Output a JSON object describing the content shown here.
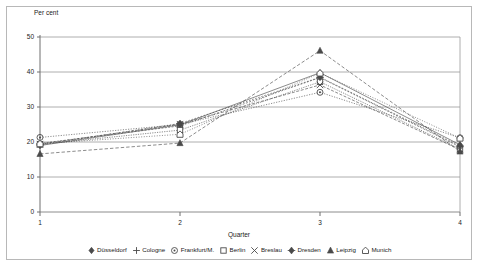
{
  "chart_data": {
    "type": "line",
    "title": "",
    "xlabel": "Quarter",
    "ylabel": "Per cent",
    "x": [
      1,
      2,
      3,
      4
    ],
    "xtick_labels": [
      "1",
      "2",
      "3",
      "4"
    ],
    "ytick_labels": [
      "0",
      "10",
      "20",
      "30",
      "40",
      "50"
    ],
    "yticks": [
      0,
      10,
      20,
      30,
      40,
      50
    ],
    "ylim": [
      0,
      50
    ],
    "xlim": [
      1,
      4
    ],
    "grid": "horizontal",
    "legend_position": "bottom",
    "series": [
      {
        "name": "Düsseldorf",
        "marker": "diamond-filled",
        "values": [
          19.0,
          24.9,
          39.8,
          19.2
        ]
      },
      {
        "name": "Cologne",
        "marker": "plus",
        "values": [
          19.6,
          24.6,
          38.4,
          18.6
        ]
      },
      {
        "name": "Frankfurt/M.",
        "marker": "circle-dot",
        "values": [
          21.3,
          25.0,
          34.2,
          21.2
        ]
      },
      {
        "name": "Berlin",
        "marker": "square-open",
        "values": [
          19.3,
          23.4,
          37.2,
          18.0
        ]
      },
      {
        "name": "Breslau",
        "marker": "x-cross",
        "values": [
          19.4,
          25.1,
          36.3,
          17.8
        ]
      },
      {
        "name": "Dresden",
        "marker": "diamond-plus",
        "values": [
          19.2,
          25.3,
          38.5,
          18.9
        ]
      },
      {
        "name": "Leipzig",
        "marker": "triangle-filled",
        "values": [
          16.6,
          19.7,
          46.1,
          17.3
        ]
      },
      {
        "name": "Munich",
        "marker": "house-open",
        "values": [
          19.5,
          22.2,
          39.7,
          21.1
        ]
      }
    ]
  },
  "legend": {
    "items": [
      {
        "label": "Düsseldorf"
      },
      {
        "label": "Cologne"
      },
      {
        "label": "Frankfurt/M."
      },
      {
        "label": "Berlin"
      },
      {
        "label": "Breslau"
      },
      {
        "label": "Dresden"
      },
      {
        "label": "Leipzig"
      },
      {
        "label": "Munich"
      }
    ]
  },
  "colors": {
    "axis": "#6f6f6f",
    "grid": "#9a9a9a",
    "text": "#1a1a1a",
    "series": "#4a4a4a",
    "background": "#ffffff"
  }
}
